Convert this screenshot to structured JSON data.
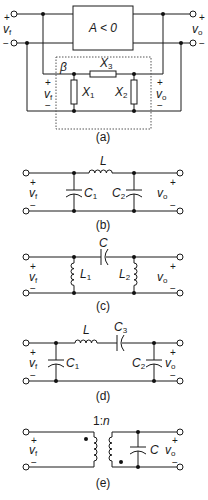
{
  "figure": {
    "panels": [
      {
        "id": "a",
        "caption": "(a)",
        "amplifier_label": "A < 0",
        "feedback_label": "β",
        "input_voltage": "v",
        "input_voltage_sub": "f",
        "output_voltage": "v",
        "output_voltage_sub": "o",
        "feedback_input_voltage": "v",
        "feedback_input_sub": "f",
        "feedback_output_voltage": "v",
        "feedback_output_sub": "o",
        "components": [
          {
            "name": "X",
            "sub": "1",
            "type": "reactance",
            "position": "shunt-left"
          },
          {
            "name": "X",
            "sub": "2",
            "type": "reactance",
            "position": "shunt-right"
          },
          {
            "name": "X",
            "sub": "3",
            "type": "reactance",
            "position": "series"
          }
        ]
      },
      {
        "id": "b",
        "caption": "(b)",
        "input_voltage": "v",
        "input_voltage_sub": "f",
        "output_voltage": "v",
        "output_voltage_sub": "o",
        "components": [
          {
            "name": "C",
            "sub": "1",
            "type": "capacitor",
            "position": "shunt-left"
          },
          {
            "name": "L",
            "sub": "",
            "type": "inductor",
            "position": "series"
          },
          {
            "name": "C",
            "sub": "2",
            "type": "capacitor",
            "position": "shunt-right"
          }
        ]
      },
      {
        "id": "c",
        "caption": "(c)",
        "input_voltage": "v",
        "input_voltage_sub": "f",
        "output_voltage": "v",
        "output_voltage_sub": "o",
        "components": [
          {
            "name": "L",
            "sub": "1",
            "type": "inductor",
            "position": "shunt-left"
          },
          {
            "name": "C",
            "sub": "",
            "type": "capacitor",
            "position": "series"
          },
          {
            "name": "L",
            "sub": "2",
            "type": "inductor",
            "position": "shunt-right"
          }
        ]
      },
      {
        "id": "d",
        "caption": "(d)",
        "input_voltage": "v",
        "input_voltage_sub": "f",
        "output_voltage": "v",
        "output_voltage_sub": "o",
        "components": [
          {
            "name": "C",
            "sub": "1",
            "type": "capacitor",
            "position": "shunt-left"
          },
          {
            "name": "L",
            "sub": "",
            "type": "inductor",
            "position": "series"
          },
          {
            "name": "C",
            "sub": "3",
            "type": "capacitor",
            "position": "series"
          },
          {
            "name": "C",
            "sub": "2",
            "type": "capacitor",
            "position": "shunt-right"
          }
        ]
      },
      {
        "id": "e",
        "caption": "(e)",
        "turns_ratio": "1:",
        "turns_ratio_n": "n",
        "input_voltage": "v",
        "input_voltage_sub": "f",
        "output_voltage": "v",
        "output_voltage_sub": "o",
        "components": [
          {
            "name": "transformer",
            "sub": "",
            "type": "transformer",
            "position": "series"
          },
          {
            "name": "C",
            "sub": "",
            "type": "capacitor",
            "position": "shunt-right"
          }
        ]
      }
    ],
    "signs": {
      "plus": "+",
      "minus": "−"
    }
  }
}
